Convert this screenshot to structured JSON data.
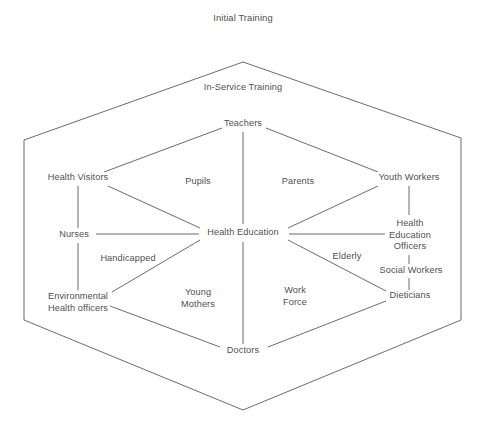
{
  "diagram": {
    "title": "Initial Training",
    "subtitle": "In-Service Training",
    "center_node": "Health Education",
    "nodes": [
      {
        "id": "teachers",
        "label": "Teachers",
        "x": 243,
        "y": 124
      },
      {
        "id": "health-visitors",
        "label": "Health Visitors",
        "x": 78,
        "y": 178
      },
      {
        "id": "youth-workers",
        "label": "Youth Workers",
        "x": 409,
        "y": 178
      },
      {
        "id": "nurses",
        "label": "Nurses",
        "x": 74,
        "y": 235
      },
      {
        "id": "health-education",
        "label": "Health Education",
        "x": 243,
        "y": 233
      },
      {
        "id": "health-education-officers",
        "label": "Health\nEducation\nOfficers",
        "x": 410,
        "y": 235
      },
      {
        "id": "social-workers",
        "label": "Social Workers",
        "x": 411,
        "y": 271
      },
      {
        "id": "environmental-health-officers",
        "label": "Environmental\nHealth officers",
        "x": 78,
        "y": 302
      },
      {
        "id": "dieticians",
        "label": "Dieticians",
        "x": 410,
        "y": 296
      },
      {
        "id": "doctors",
        "label": "Doctors",
        "x": 243,
        "y": 351
      }
    ],
    "sector_labels": [
      {
        "id": "pupils",
        "label": "Pupils",
        "x": 198,
        "y": 182
      },
      {
        "id": "parents",
        "label": "Parents",
        "x": 298,
        "y": 182
      },
      {
        "id": "handicapped",
        "label": "Handicapped",
        "x": 128,
        "y": 259
      },
      {
        "id": "elderly",
        "label": "Elderly",
        "x": 347,
        "y": 257
      },
      {
        "id": "young-mothers",
        "label": "Young\nMothers",
        "x": 198,
        "y": 298
      },
      {
        "id": "work-force",
        "label": "Work\nForce",
        "x": 295,
        "y": 296
      }
    ],
    "colors": {
      "line": "#5a5a5a",
      "text": "#4f4f4f",
      "background": "#ffffff"
    },
    "outer_hexagon": {
      "points": "243,62 461,138 461,320 243,410 24,320 24,140"
    },
    "inner_hexagon": {
      "points": "243,124 409,178 410,296 243,351 78,302 78,178"
    }
  }
}
